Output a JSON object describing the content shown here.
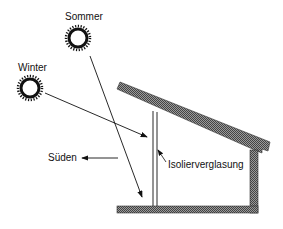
{
  "diagram": {
    "type": "passive-solar-section",
    "labels": {
      "summer": "Sommer",
      "winter": "Winter",
      "south": "Süden",
      "glazing": "Isolierverglasung"
    },
    "icons": {
      "summer_sun": "sun-icon",
      "winter_sun": "sun-icon"
    },
    "colors": {
      "line": "#111111",
      "hatch": "#555555",
      "background": "#ffffff"
    }
  }
}
